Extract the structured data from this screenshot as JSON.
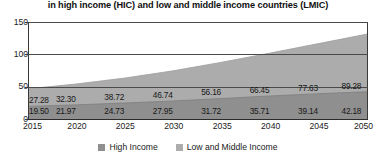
{
  "chart_data": {
    "type": "area",
    "stacked": true,
    "title": "in high income (HIC) and low and middle income countries (LMIC)",
    "xlabel": "",
    "ylabel": "",
    "categories": [
      "2015",
      "2020",
      "2025",
      "2030",
      "2035",
      "2040",
      "2045",
      "2050"
    ],
    "series": [
      {
        "name": "High Income",
        "color": "#8f8f8f",
        "values": [
          19.5,
          21.97,
          24.73,
          27.95,
          31.72,
          35.71,
          39.14,
          42.18
        ],
        "labels": [
          "19.50",
          "21.97",
          "24.73",
          "27.95",
          "31.72",
          "35.71",
          "39.14",
          "42.18"
        ]
      },
      {
        "name": "Low and Middle Income",
        "color": "#acacac",
        "values": [
          27.28,
          32.3,
          38.72,
          46.74,
          56.16,
          66.45,
          77.63,
          89.28
        ],
        "labels": [
          "27.28",
          "32.30",
          "38.72",
          "46.74",
          "56.16",
          "66.45",
          "77.63",
          "89.28"
        ]
      }
    ],
    "ylim": [
      0,
      150
    ],
    "yticks": [
      "0",
      "50",
      "100",
      "150"
    ],
    "ytick_values": [
      0,
      50,
      100,
      150
    ],
    "grid": true,
    "legend_position": "bottom"
  },
  "legend": {
    "items": [
      {
        "label": "High Income",
        "color": "#8f8f8f"
      },
      {
        "label": "Low and Middle Income",
        "color": "#acacac"
      }
    ]
  },
  "colors": {
    "high_income": "#8f8f8f",
    "low_and_middle_income": "#acacac",
    "axis": "#3a3a3a",
    "text": "#1a1a1a",
    "background": "#ffffff"
  }
}
